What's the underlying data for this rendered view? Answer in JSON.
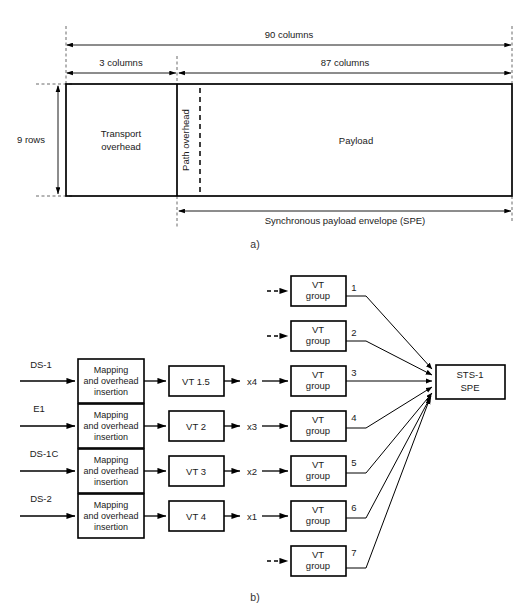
{
  "figure": {
    "part_a_label": "a)",
    "part_b_label": "b)"
  },
  "frame_a": {
    "dimensions": {
      "total_columns": "90 columns",
      "overhead_columns": "3 columns",
      "payload_columns": "87 columns",
      "rows": "9 rows"
    },
    "regions": {
      "transport_overhead_line1": "Transport",
      "transport_overhead_line2": "overhead",
      "path_overhead": "Path overhead",
      "payload": "Payload"
    },
    "spe_label": "Synchronous payload envelope (SPE)"
  },
  "frame_b": {
    "tributaries": [
      {
        "source": "DS-1",
        "mapping_line1": "Mapping",
        "mapping_line2": "and overhead",
        "mapping_line3": "insertion",
        "vt_type": "VT 1.5",
        "multiplier": "x4",
        "group_index": "3"
      },
      {
        "source": "E1",
        "mapping_line1": "Mapping",
        "mapping_line2": "and overhead",
        "mapping_line3": "insertion",
        "vt_type": "VT 2",
        "multiplier": "x3",
        "group_index": "4"
      },
      {
        "source": "DS-1C",
        "mapping_line1": "Mapping",
        "mapping_line2": "and overhead",
        "mapping_line3": "insertion",
        "vt_type": "VT 3",
        "multiplier": "x2",
        "group_index": "5"
      },
      {
        "source": "DS-2",
        "mapping_line1": "Mapping",
        "mapping_line2": "and overhead",
        "mapping_line3": "insertion",
        "vt_type": "VT 4",
        "multiplier": "x1",
        "group_index": "6"
      }
    ],
    "vt_groups": [
      {
        "line1": "VT",
        "line2": "group",
        "number": "1",
        "input": "dashed"
      },
      {
        "line1": "VT",
        "line2": "group",
        "number": "2",
        "input": "dashed"
      },
      {
        "line1": "VT",
        "line2": "group",
        "number": "3",
        "input": "solid"
      },
      {
        "line1": "VT",
        "line2": "group",
        "number": "4",
        "input": "solid"
      },
      {
        "line1": "VT",
        "line2": "group",
        "number": "5",
        "input": "solid"
      },
      {
        "line1": "VT",
        "line2": "group",
        "number": "6",
        "input": "solid"
      },
      {
        "line1": "VT",
        "line2": "group",
        "number": "7",
        "input": "dashed"
      }
    ],
    "output": {
      "line1": "STS-1",
      "line2": "SPE"
    }
  },
  "colors": {
    "stroke": "#000000",
    "background": "#ffffff",
    "text": "#1a1a1a"
  }
}
